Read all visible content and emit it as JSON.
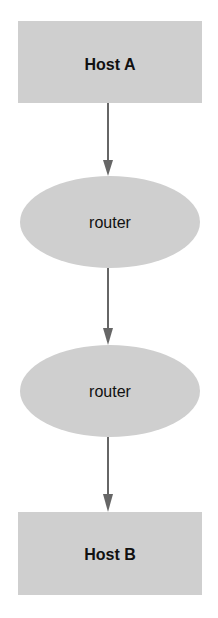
{
  "diagram": {
    "type": "network-path",
    "colors": {
      "node_fill": "#cfcfcf",
      "edge": "#666666",
      "text": "#111111",
      "background": "#ffffff"
    },
    "nodes": [
      {
        "id": "host-a",
        "shape": "rectangle",
        "label": "Host A"
      },
      {
        "id": "router-1",
        "shape": "ellipse",
        "label": "router"
      },
      {
        "id": "router-2",
        "shape": "ellipse",
        "label": "router"
      },
      {
        "id": "host-b",
        "shape": "rectangle",
        "label": "Host B"
      }
    ],
    "edges": [
      {
        "from": "host-a",
        "to": "router-1"
      },
      {
        "from": "router-1",
        "to": "router-2"
      },
      {
        "from": "router-2",
        "to": "host-b"
      }
    ]
  }
}
